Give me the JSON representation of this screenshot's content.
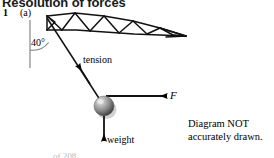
{
  "heading": "Resolution of forces",
  "question": {
    "number": "1",
    "part": "(a)"
  },
  "labels": {
    "angle": "40°",
    "tension": "tension",
    "weight": "weight",
    "force": "F"
  },
  "note": {
    "line1": "Diagram NOT",
    "line2": "accurately drawn."
  },
  "footer_ghost": "of 208",
  "icons": {
    "ball": "sphere-mass-icon",
    "tension_arrow": "tension-arrow-icon",
    "weight_arrow": "weight-arrow-icon",
    "force_arrow": "force-arrow-icon",
    "truss": "truss-structure-icon",
    "angle_arc": "angle-arc-icon",
    "vertical_reference": "vertical-reference-line-icon"
  },
  "colors": {
    "ink": "#000000",
    "heading": "#1a1a1a",
    "ball_light": "#d8d8d8",
    "ball_mid": "#8a8a8a",
    "ball_dark": "#3a3a3a",
    "page": "#ffffff",
    "ghost": "#b9b9b9"
  },
  "geometry": {
    "truss_apex": [
      47,
      16
    ],
    "truss_tip": [
      186,
      36
    ],
    "ball_center": [
      104,
      106
    ],
    "ball_radius": 10,
    "angle_value_deg": 40
  }
}
